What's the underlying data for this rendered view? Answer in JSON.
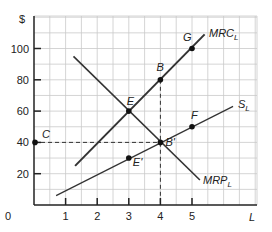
{
  "chart_data": {
    "type": "line",
    "title": "",
    "xlabel": "L",
    "ylabel": "$",
    "xlim": [
      0,
      7
    ],
    "ylim": [
      0,
      120
    ],
    "x_ticks": [
      "0",
      "1",
      "2",
      "3",
      "4",
      "5"
    ],
    "y_ticks": [
      "20",
      "40",
      "60",
      "80",
      "100"
    ],
    "grid": true,
    "series": [
      {
        "name": "MRC_L",
        "label": "MRC",
        "sub": "L",
        "points": [
          [
            1.3,
            25
          ],
          [
            5.4,
            109
          ]
        ]
      },
      {
        "name": "MRP_L",
        "label": "MRP",
        "sub": "L",
        "points": [
          [
            1.25,
            95
          ],
          [
            5.25,
            16
          ]
        ]
      },
      {
        "name": "S_L",
        "label": "S",
        "sub": "L",
        "points": [
          [
            0.7,
            6
          ],
          [
            6.3,
            63
          ]
        ]
      }
    ],
    "points": [
      {
        "label": "C",
        "x": 0,
        "y": 40
      },
      {
        "label": "E",
        "x": 3,
        "y": 60
      },
      {
        "label": "B",
        "x": 4,
        "y": 80
      },
      {
        "label": "G",
        "x": 5,
        "y": 100
      },
      {
        "label": "B'",
        "x": 4,
        "y": 40
      },
      {
        "label": "E'",
        "x": 3,
        "y": 30
      },
      {
        "label": "F",
        "x": 5,
        "y": 50
      }
    ],
    "dashed_guides": [
      {
        "from": [
          0,
          40
        ],
        "to": [
          4,
          40
        ]
      },
      {
        "from": [
          4,
          80
        ],
        "to": [
          4,
          0
        ]
      }
    ]
  }
}
